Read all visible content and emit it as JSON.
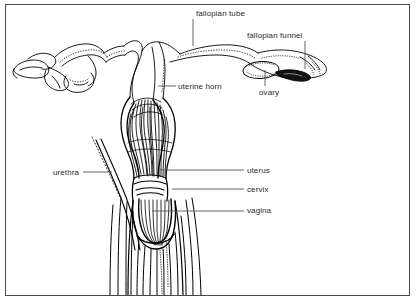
{
  "figure": {
    "style": "black ink line drawing with stipple shading on white background",
    "border_color": "#4a4a4a",
    "background_color": "#ffffff",
    "ink_color": "#000000",
    "label_color": "#2b2b2b",
    "leader_color": "#555555"
  },
  "labels": [
    {
      "id": "fallopian-tube",
      "text": "fallopian tube",
      "x": 196,
      "y": 9,
      "align": "left",
      "leader": {
        "type": "vertical",
        "x1": 193,
        "y1": 19,
        "x2": 193,
        "y2": 46
      }
    },
    {
      "id": "fallopian-funnel",
      "text": "fallopian funnel",
      "x": 247,
      "y": 31,
      "align": "left",
      "leader": {
        "type": "vertical",
        "x1": 305,
        "y1": 41,
        "x2": 305,
        "y2": 69
      }
    },
    {
      "id": "uterine-horn",
      "text": "uterine horn",
      "x": 178,
      "y": 82,
      "align": "left",
      "leader": {
        "type": "horizontal",
        "x1": 158,
        "y1": 86,
        "x2": 176,
        "y2": 86
      }
    },
    {
      "id": "ovary",
      "text": "ovary",
      "x": 259,
      "y": 88,
      "align": "left",
      "leader": {
        "type": "vertical",
        "x1": 265,
        "y1": 70,
        "x2": 265,
        "y2": 86
      }
    },
    {
      "id": "urethra",
      "text": "urethra",
      "x": 53,
      "y": 168,
      "align": "left",
      "leader": {
        "type": "horizontal",
        "x1": 83,
        "y1": 172,
        "x2": 112,
        "y2": 172
      }
    },
    {
      "id": "uterus",
      "text": "uterus",
      "x": 247,
      "y": 166,
      "align": "left",
      "leader": {
        "type": "horizontal",
        "x1": 160,
        "y1": 170,
        "x2": 244,
        "y2": 170
      }
    },
    {
      "id": "cervix",
      "text": "cervix",
      "x": 247,
      "y": 185,
      "align": "left",
      "leader": {
        "type": "horizontal",
        "x1": 172,
        "y1": 189,
        "x2": 244,
        "y2": 189
      }
    },
    {
      "id": "vagina",
      "text": "vagina",
      "x": 247,
      "y": 206,
      "align": "left",
      "leader": {
        "type": "horizontal",
        "x1": 152,
        "y1": 211,
        "x2": 244,
        "y2": 211
      }
    }
  ],
  "structures": [
    {
      "id": "left-fallopian-funnel",
      "name": "left fallopian funnel (fimbriated end)",
      "region": "far left, x 12-40, y 55-85"
    },
    {
      "id": "left-fallopian-tube",
      "name": "left fallopian tube (coiled)",
      "region": "left, x 30-120, y 38-82"
    },
    {
      "id": "left-uterine-horn",
      "name": "left uterine horn",
      "region": "x 115-150, y 42-105"
    },
    {
      "id": "right-uterine-horn",
      "name": "right uterine horn",
      "region": "x 150-180, y 42-105"
    },
    {
      "id": "right-fallopian-tube",
      "name": "right fallopian tube",
      "region": "x 175-250, y 45-70"
    },
    {
      "id": "ovary",
      "name": "ovary (stippled oval)",
      "region": "x 243-278, y 62-78"
    },
    {
      "id": "right-fallopian-funnel",
      "name": "right fallopian funnel with dark opening",
      "region": "x 278-330, y 60-82"
    },
    {
      "id": "uterus-body",
      "name": "uterus body with longitudinal muscle striations",
      "region": "x 128-188, y 95-180"
    },
    {
      "id": "cervix",
      "name": "cervix with transverse bands",
      "region": "x 132-185, y 178-198"
    },
    {
      "id": "vagina",
      "name": "vagina, cup shaped with striations",
      "region": "x 132-188, y 198-248"
    },
    {
      "id": "urethra",
      "name": "urethra, thin paired tube with dotted outline",
      "region": "x 92-140, y 140-250"
    },
    {
      "id": "lower-tract",
      "name": "lower tract longitudinal fibers extending to frame bottom",
      "region": "x 108-205, y 240-294"
    }
  ]
}
